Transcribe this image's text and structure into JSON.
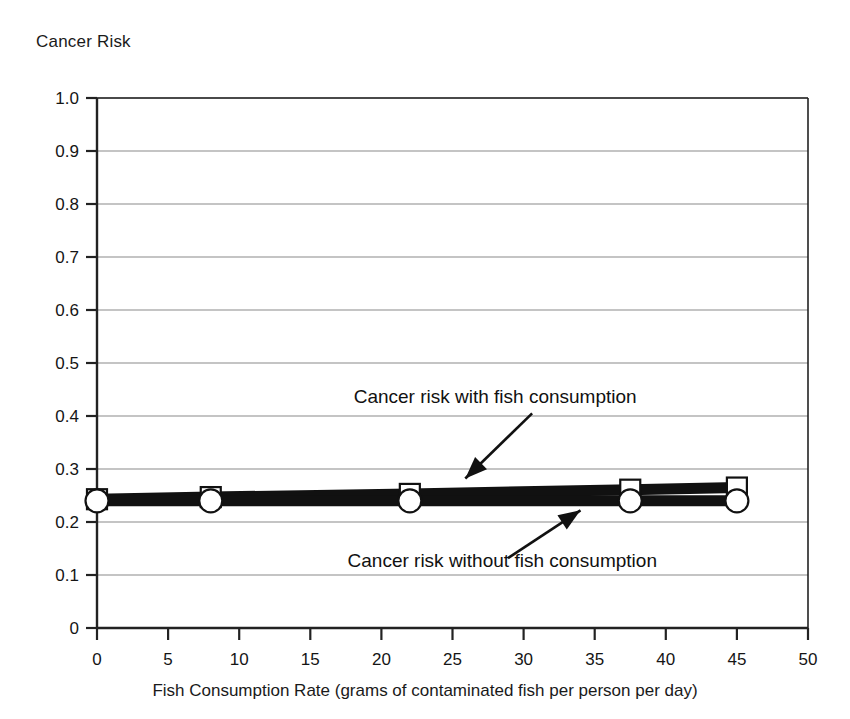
{
  "chart_data": {
    "type": "line",
    "title": "",
    "ylabel": "Cancer Risk",
    "xlabel": "Fish Consumption Rate (grams of contaminated fish per person per day)",
    "xlim": [
      0,
      50
    ],
    "ylim": [
      0,
      1.0
    ],
    "xticks": [
      "0",
      "5",
      "10",
      "15",
      "20",
      "25",
      "30",
      "35",
      "40",
      "45",
      "50"
    ],
    "xtick_values": [
      0,
      5,
      10,
      15,
      20,
      25,
      30,
      35,
      40,
      45,
      50
    ],
    "yticks": [
      "0",
      "0.1",
      "0.2",
      "0.3",
      "0.4",
      "0.5",
      "0.6",
      "0.7",
      "0.8",
      "0.9",
      "1.0"
    ],
    "ytick_values": [
      0,
      0.1,
      0.2,
      0.3,
      0.4,
      0.5,
      0.6,
      0.7,
      0.8,
      0.9,
      1.0
    ],
    "grid": "horizontal",
    "legend": "annotations",
    "x": [
      0,
      8,
      22,
      37.5,
      45
    ],
    "series": [
      {
        "name": "Cancer risk with fish consumption",
        "marker": "square",
        "values": [
          0.243,
          0.247,
          0.253,
          0.261,
          0.265
        ]
      },
      {
        "name": "Cancer risk without fish consumption",
        "marker": "circle",
        "values": [
          0.24,
          0.24,
          0.24,
          0.24,
          0.24
        ]
      }
    ],
    "annotations": [
      {
        "text": "Cancer risk with fish consumption",
        "text_x": 28.0,
        "text_y": 0.425,
        "arrow_from_x": 30.6,
        "arrow_from_y": 0.405,
        "arrow_to_x": 25.9,
        "arrow_to_y": 0.282
      },
      {
        "text": "Cancer risk without fish consumption",
        "text_x": 28.5,
        "text_y": 0.115,
        "arrow_from_x": 28.9,
        "arrow_from_y": 0.132,
        "arrow_to_x": 34.0,
        "arrow_to_y": 0.222
      }
    ],
    "colors": {
      "line": "#111111",
      "grid": "#8a8a8a",
      "axis": "#222222",
      "marker_fill": "#ffffff",
      "marker_stroke": "#111111",
      "background": "#ffffff"
    }
  }
}
